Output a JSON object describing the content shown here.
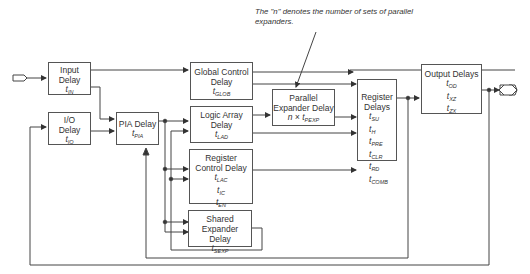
{
  "annotation": {
    "line1": "The \"n\" denotes the number of sets of parallel",
    "line2": "expanders."
  },
  "blocks": {
    "input_delay": {
      "title1": "Input",
      "title2": "Delay",
      "param": "t",
      "param_sub": "IN"
    },
    "io_delay": {
      "title1": "I/O",
      "title2": "Delay",
      "param": "t",
      "param_sub": "IO"
    },
    "pia_delay": {
      "title1": "PIA Delay",
      "param": "t",
      "param_sub": "PIA"
    },
    "global_control_delay": {
      "title1": "Global Control",
      "title2": "Delay",
      "param": "t",
      "param_sub": "GLOB"
    },
    "logic_array_delay": {
      "title1": "Logic Array",
      "title2": "Delay",
      "param": "t",
      "param_sub": "LAD"
    },
    "register_control_delay": {
      "title1": "Register",
      "title2": "Control Delay",
      "params": [
        {
          "t": "t",
          "sub": "LAC"
        },
        {
          "t": "t",
          "sub": "IC"
        },
        {
          "t": "t",
          "sub": "EN"
        }
      ]
    },
    "shared_expander_delay": {
      "title1": "Shared Expander",
      "title2": "Delay",
      "param": "t",
      "param_sub": "SEXP"
    },
    "parallel_expander_delay": {
      "title1": "Parallel",
      "title2": "Expander Delay",
      "param_prefix": "n × ",
      "param": "t",
      "param_sub": "PEXP"
    },
    "register_delays": {
      "title1": "Register",
      "title2": "Delays",
      "params": [
        {
          "t": "t",
          "sub": "SU"
        },
        {
          "t": "t",
          "sub": "H"
        },
        {
          "t": "t",
          "sub": "PRE"
        },
        {
          "t": "t",
          "sub": "CLR"
        },
        {
          "t": "t",
          "sub": "RD"
        },
        {
          "t": "t",
          "sub": "COMB"
        }
      ]
    },
    "output_delays": {
      "title1": "Output Delays",
      "params": [
        {
          "t": "t",
          "sub": "OD"
        },
        {
          "t": "t",
          "sub": "XZ"
        },
        {
          "t": "t",
          "sub": "ZX"
        }
      ]
    }
  },
  "colors": {
    "line": "#444444",
    "box_border": "#555555",
    "text": "#333333"
  }
}
